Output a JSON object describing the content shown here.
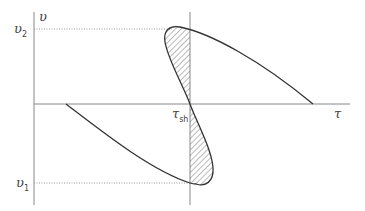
{
  "diagram": {
    "axes": {
      "y_label": "υ",
      "x_label": "τ"
    },
    "labels": {
      "v2_main": "υ",
      "v2_sub": "2",
      "v1_main": "υ",
      "v1_sub": "1",
      "tau_sh_main": "τ",
      "tau_sh_sub": "sh"
    },
    "colors": {
      "axis": "#888888",
      "curve": "#333333",
      "hatch": "#555555",
      "dotted": "#999999"
    }
  }
}
